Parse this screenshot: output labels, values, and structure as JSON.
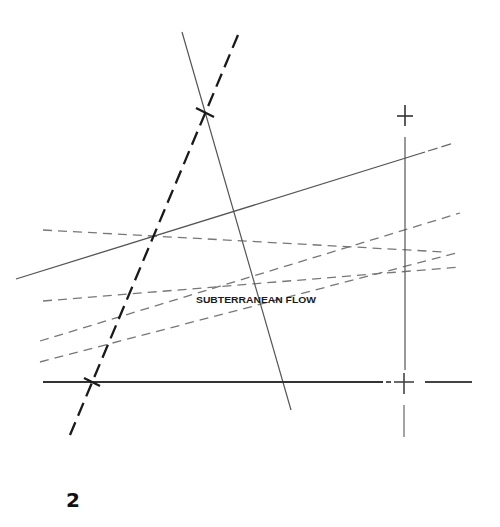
{
  "diagram": {
    "label": "SUBTERRANEAN FLOW",
    "figure_number": "2",
    "colors": {
      "background": "#ffffff",
      "heavy_line": "#1a1a1a",
      "thin_line": "#555555",
      "dashed_line": "#777777"
    },
    "lines": [
      {
        "name": "heavy-dashed-diagonal",
        "style": "heavy-dashed",
        "from": [
          238,
          35
        ],
        "to": [
          70,
          435
        ]
      },
      {
        "name": "thin-diagonal",
        "style": "thin-solid",
        "from": [
          182,
          32
        ],
        "to": [
          291,
          410
        ]
      },
      {
        "name": "solid-rising-line",
        "style": "solid",
        "from": [
          16,
          279
        ],
        "to": [
          425,
          152
        ],
        "dashed_extension_to": [
          454,
          143
        ]
      },
      {
        "name": "vertical-line",
        "style": "thin-solid",
        "from": [
          405,
          137
        ],
        "to": [
          405,
          378
        ]
      },
      {
        "name": "bottom-horizontal-line",
        "style": "heavy-solid",
        "from": [
          43,
          382
        ],
        "to": [
          383,
          382
        ]
      },
      {
        "name": "dashed-line-1",
        "style": "dashed",
        "from": [
          43,
          230
        ],
        "to": [
          445,
          252
        ]
      },
      {
        "name": "dashed-line-2",
        "style": "dashed",
        "from": [
          43,
          301
        ],
        "to": [
          460,
          267
        ]
      },
      {
        "name": "dashed-line-3",
        "style": "dashed",
        "from": [
          40,
          341
        ],
        "to": [
          460,
          213
        ]
      },
      {
        "name": "dashed-line-4",
        "style": "dashed",
        "from": [
          40,
          362
        ],
        "to": [
          460,
          252
        ]
      }
    ],
    "markers": [
      {
        "name": "cross-marker-top",
        "at": [
          205,
          112
        ]
      },
      {
        "name": "cross-marker-bottom",
        "at": [
          92,
          382
        ]
      },
      {
        "name": "plus-marker-top-right",
        "at": [
          405,
          116
        ]
      },
      {
        "name": "plus-marker-bottom-right",
        "at": [
          404,
          382
        ]
      }
    ]
  }
}
